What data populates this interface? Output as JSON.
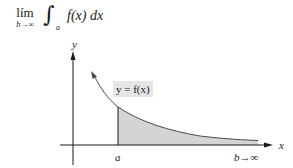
{
  "formula": {
    "lim_word": "lím",
    "lim_subscript": "b→∞",
    "integral_sign": "∫",
    "lower_limit": "a",
    "integrand": "f(x) dx"
  },
  "graph": {
    "y_axis_label": "y",
    "x_axis_label": "x",
    "curve_label": "y = f(x)",
    "point_a_label": "a",
    "point_b_label": "b→∞",
    "colors": {
      "axis": "#1a1a1a",
      "curve": "#4a4a4a",
      "shade": "#d4d4d4",
      "label_bg": "#e6e6e6"
    }
  }
}
